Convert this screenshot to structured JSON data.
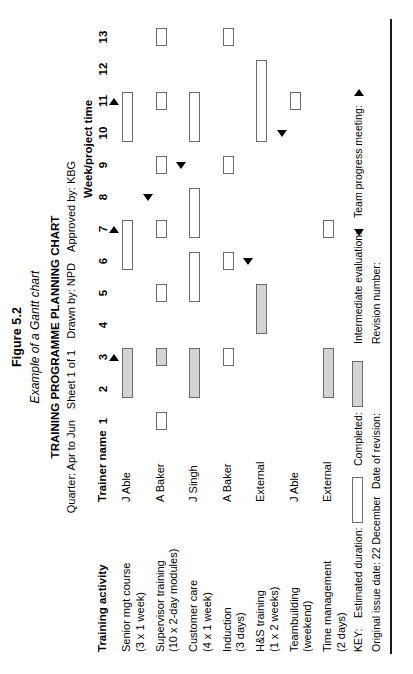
{
  "figure": {
    "number": "Figure 5.2",
    "caption": "Example of a Gantt chart"
  },
  "chart_title": "TRAINING PROGRAMME PLANNING CHART",
  "meta": {
    "quarter": "Quarter: Apr to Jun",
    "sheet": "Sheet 1 of 1",
    "drawn_by": "Drawn by: NPD",
    "approved_by": "Approved by: KBG"
  },
  "headers": {
    "activity": "Training activity",
    "trainer": "Trainer name",
    "week": "Week/project time"
  },
  "key": {
    "label": "KEY:",
    "estimated_duration": "Estimated duration:",
    "completed": "Completed:",
    "intermediate_evaluation": "Intermediate evaluation:",
    "team_progress_meeting": "Team progress meeting:",
    "original_issue_date": "Original issue date: 22 December",
    "date_of_revision": "Date of revision:",
    "revision_number": "Revision number:"
  },
  "colors": {
    "bar_outline": "#6b6b6b",
    "bar_estimated": "#ffffff",
    "bar_completed": "#d4d4d4",
    "marker": "#000000",
    "rule": "#1a1a1a"
  },
  "chart_data": {
    "type": "bar",
    "title": "TRAINING PROGRAMME PLANNING CHART",
    "xlabel": "Week/project time",
    "ylabel": "Training activity",
    "xlim": [
      1,
      13
    ],
    "grid": false,
    "weeks": [
      "1",
      "2",
      "3",
      "4",
      "5",
      "6",
      "7",
      "8",
      "9",
      "10",
      "11",
      "12",
      "13"
    ],
    "rows": [
      {
        "activity": "Senior mgt course\n(3 x 1 week)",
        "trainer": "J Able",
        "bars": [
          {
            "start": 2,
            "end": 3,
            "status": "completed"
          },
          {
            "start": 6,
            "end": 7,
            "status": "estimated"
          },
          {
            "start": 10,
            "end": 11,
            "status": "estimated"
          }
        ],
        "markers": [
          {
            "week": 3,
            "type": "team-progress-meeting"
          },
          {
            "week": 7,
            "type": "team-progress-meeting"
          },
          {
            "week": 11,
            "type": "team-progress-meeting"
          }
        ]
      },
      {
        "activity": "Supervisor training\n(10 x 2-day modules)",
        "trainer": "A Baker",
        "bars": [
          {
            "start": 1,
            "end": 1,
            "status": "estimated"
          },
          {
            "start": 3,
            "end": 3,
            "status": "completed"
          },
          {
            "start": 5,
            "end": 5,
            "status": "estimated"
          },
          {
            "start": 7,
            "end": 7,
            "status": "estimated"
          },
          {
            "start": 9,
            "end": 9,
            "status": "estimated"
          },
          {
            "start": 11,
            "end": 11,
            "status": "estimated"
          },
          {
            "start": 13,
            "end": 13,
            "status": "estimated"
          }
        ],
        "markers": [
          {
            "week": 8,
            "type": "intermediate-evaluation"
          }
        ]
      },
      {
        "activity": "Customer care\n(4 x 1 week)",
        "trainer": "J Singh",
        "bars": [
          {
            "start": 2,
            "end": 3,
            "status": "completed"
          },
          {
            "start": 5,
            "end": 6,
            "status": "estimated"
          },
          {
            "start": 7,
            "end": 8,
            "status": "estimated"
          },
          {
            "start": 10,
            "end": 11,
            "status": "estimated"
          }
        ],
        "markers": [
          {
            "week": 9,
            "type": "intermediate-evaluation"
          }
        ]
      },
      {
        "activity": "Induction\n(3 days)",
        "trainer": "A Baker",
        "bars": [
          {
            "start": 3,
            "end": 3,
            "status": "estimated"
          },
          {
            "start": 6,
            "end": 6,
            "status": "estimated"
          },
          {
            "start": 9,
            "end": 9,
            "status": "estimated"
          },
          {
            "start": 13,
            "end": 13,
            "status": "estimated"
          }
        ],
        "markers": []
      },
      {
        "activity": "H&S training\n(1 x 2 weeks)",
        "trainer": "External",
        "bars": [
          {
            "start": 4,
            "end": 5,
            "status": "completed"
          },
          {
            "start": 10,
            "end": 12,
            "status": "estimated"
          }
        ],
        "markers": [
          {
            "week": 6,
            "type": "intermediate-evaluation"
          }
        ]
      },
      {
        "activity": "Teambuilding\n(weekend)",
        "trainer": "J Able",
        "bars": [
          {
            "start": 11,
            "end": 11,
            "status": "estimated"
          }
        ],
        "markers": [
          {
            "week": 10,
            "type": "intermediate-evaluation"
          }
        ]
      },
      {
        "activity": "Time management\n(2 days)",
        "trainer": "External",
        "bars": [
          {
            "start": 2,
            "end": 3,
            "status": "completed"
          },
          {
            "start": 7,
            "end": 7,
            "status": "estimated"
          }
        ],
        "markers": []
      }
    ]
  }
}
